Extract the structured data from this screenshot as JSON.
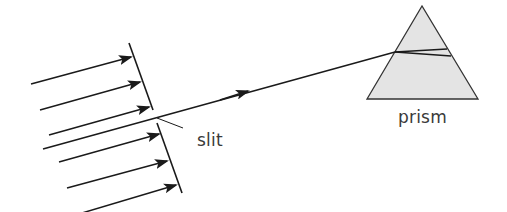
{
  "labels": {
    "slit": "slit",
    "prism": "prism"
  },
  "colors": {
    "line": "#1a1a1a",
    "prism_fill": "#e2e2e2",
    "prism_stroke": "#333333",
    "text": "#3a3a3a",
    "background": "#ffffff"
  },
  "incident_rays": {
    "count_above_slit": 3,
    "count_below_slit": 3,
    "direction": "left-to-right, slightly upward"
  },
  "transmitted_beam": {
    "from": "slit",
    "to": "prism",
    "has_arrowhead": true
  },
  "prism": {
    "shape": "triangle",
    "internal_rays": 2
  }
}
